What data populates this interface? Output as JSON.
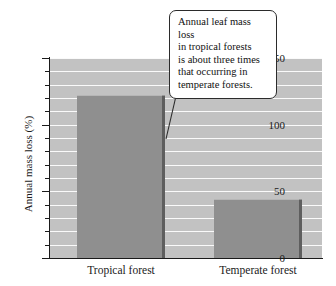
{
  "chart_data": {
    "type": "bar",
    "title": "",
    "xlabel": "",
    "ylabel": "Annual mass loss (%)",
    "categories": [
      "Tropical forest",
      "Temperate forest"
    ],
    "values": [
      122,
      44
    ],
    "ylim": [
      0,
      150
    ],
    "ytick_labels": [
      "0",
      "50",
      "100",
      "150"
    ],
    "ytick_values": [
      0,
      50,
      100,
      150
    ],
    "minor_tick_step": 10,
    "grid": true,
    "grid_orientation": "horizontal",
    "legend": false,
    "annotations": [
      {
        "text": "Annual leaf mass loss in tropical forests is about three times that occurring in temperate forests.",
        "lines": [
          "Annual leaf mass loss",
          "in tropical forests",
          "is about three times",
          "that occurring in",
          "temperate forests."
        ]
      }
    ],
    "colors": {
      "bar_fill": "#8f8f8f",
      "bar_shadow": "#3d3d3d",
      "plot_background": "#c2c2c2",
      "gridline": "#ffffff",
      "axis": "#1a1a1a",
      "callout_background": "#ffffff",
      "callout_border": "#2b2b2b"
    }
  }
}
